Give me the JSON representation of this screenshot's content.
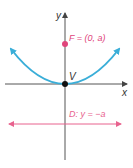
{
  "diagram": {
    "type": "parabola-focus-directrix",
    "axes": {
      "x_label": "x",
      "y_label": "y"
    },
    "vertex": {
      "label": "V"
    },
    "focus": {
      "label": "F = (0, a)"
    },
    "directrix": {
      "label": "D: y = −a"
    },
    "colors": {
      "parabola": "#3aaed8",
      "focus": "#e0457b",
      "directrix": "#e8628e",
      "axes": "#555555",
      "vertex": "#111111"
    }
  }
}
